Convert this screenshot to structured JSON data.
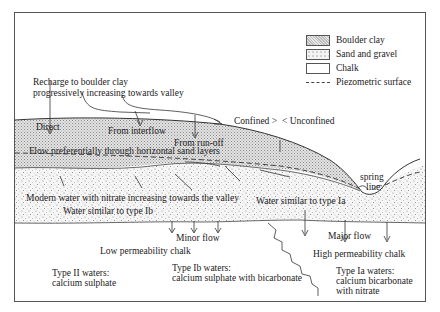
{
  "legend": {
    "items": [
      {
        "label": "Boulder clay",
        "pattern": "boulder-clay"
      },
      {
        "label": "Sand and gravel",
        "pattern": "sand-gravel"
      },
      {
        "label": "Chalk",
        "pattern": "chalk"
      },
      {
        "label": "Piezometric surface",
        "pattern": "dashed-line"
      }
    ]
  },
  "labels": {
    "recharge_line1": "Recharge to boulder clay",
    "recharge_line2": "progressively increasing towards valley",
    "direct": "Direct",
    "from_interflow": "From interflow",
    "from_runoff": "From run-off",
    "confined": "Confined >",
    "unconfined": "< Unconfined",
    "flow_sand_layers": "Flow preferentially through horizontal sand layers",
    "modern_water": "Modern water with nitrate increasing towards the valley",
    "water_type_ib": "Water similar to type Ib",
    "water_type_ia": "Water similar to type Ia",
    "spring_line1": "spring",
    "spring_line2": "line",
    "minor_flow": "Minor flow",
    "major_flow": "Major flow",
    "low_perm": "Low permeability chalk",
    "high_perm": "High permeability chalk",
    "type2_title": "Type II waters:",
    "type2_desc": "calcium sulphate",
    "type1b_title": "Type Ib waters:",
    "type1b_desc": "calcium sulphate with bicarbonate",
    "type1a_title": "Type Ia waters:",
    "type1a_desc1": "calcium bicarbonate",
    "type1a_desc2": "with nitrate"
  },
  "colors": {
    "boulder_clay": "#d6d6d6",
    "sand_gravel": "#ececec",
    "chalk": "#ffffff",
    "line": "#333333"
  }
}
